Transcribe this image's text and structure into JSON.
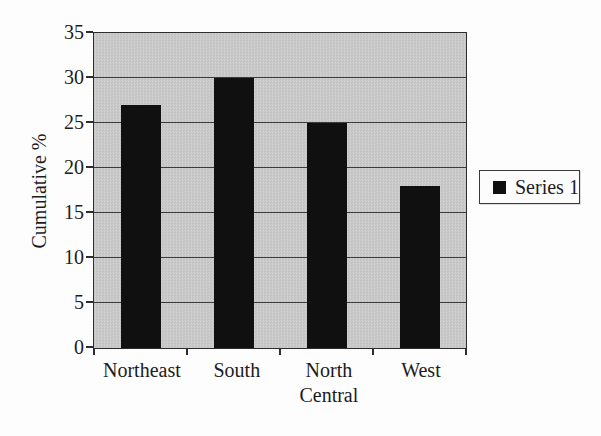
{
  "chart_data": {
    "type": "bar",
    "categories": [
      "Northeast",
      "South",
      "North Central",
      "West"
    ],
    "series": [
      {
        "name": "Series 1",
        "values": [
          27,
          30,
          25,
          18
        ]
      }
    ],
    "title": "",
    "xlabel": "",
    "ylabel": "Cumulative %",
    "ylim": [
      0,
      35
    ],
    "yticks": [
      0,
      5,
      10,
      15,
      20,
      25,
      30,
      35
    ],
    "grid": true,
    "legend_position": "right",
    "colors": {
      "bar": "#101010",
      "plot_background": "#c8c8c8",
      "gridline": "#3c3c3c",
      "axis": "#2d2d2d",
      "page_background": "#fdfdfd",
      "legend_background": "#fcfcfc"
    }
  }
}
